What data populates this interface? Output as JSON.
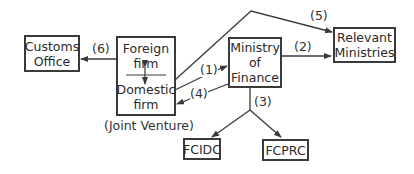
{
  "nodes": {
    "customs": {
      "line1": "Customs",
      "line2": "Office"
    },
    "joint_venture": {
      "top_line1": "Foreign",
      "top_line2": "firm",
      "bottom_line1": "Domestic",
      "bottom_line2": "firm",
      "caption": "(Joint Venture)"
    },
    "mof": {
      "line1": "Ministry",
      "line2": "of",
      "line3": "Finance"
    },
    "relevant": {
      "line1": "Relevant",
      "line2": "Ministries"
    },
    "fcidc": {
      "label": "FCIDC"
    },
    "fcprc": {
      "label": "FCPRC"
    }
  },
  "edges": [
    {
      "id": "1",
      "label": "(1)",
      "from": "joint_venture",
      "to": "mof"
    },
    {
      "id": "2",
      "label": "(2)",
      "from": "mof",
      "to": "relevant"
    },
    {
      "id": "3",
      "label": "(3)",
      "from": "mof",
      "to": [
        "fcidc",
        "fcprc"
      ]
    },
    {
      "id": "4",
      "label": "(4)",
      "from": "mof",
      "to": "joint_venture"
    },
    {
      "id": "5",
      "label": "(5)",
      "from": "joint_venture",
      "to": "relevant"
    },
    {
      "id": "6",
      "label": "(6)",
      "from": "joint_venture",
      "to": "customs"
    }
  ],
  "colors": {
    "line": "#3a3a3a",
    "background": "#ffffff"
  }
}
